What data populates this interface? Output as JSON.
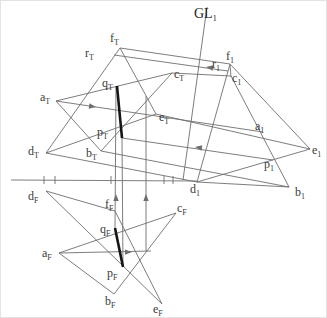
{
  "figure": {
    "width": 327,
    "height": 318,
    "background": "#ffffff",
    "line_color": "#6e6e6e",
    "line_width": 0.9,
    "thick_color": "#151515",
    "thick_width": 2.6,
    "label_color": "#3a3a3a",
    "tick_y1": 175,
    "tick_y2": 183,
    "segments": [
      {
        "name": "edge-fT-dT",
        "x1": 119,
        "y1": 47,
        "x2": 45,
        "y2": 152
      },
      {
        "name": "edge-fT-eT",
        "x1": 119,
        "y1": 47,
        "x2": 155,
        "y2": 113
      },
      {
        "name": "edge-dT-eT",
        "x1": 45,
        "y1": 152,
        "x2": 155,
        "y2": 113
      },
      {
        "name": "edge-aT-bT",
        "x1": 55,
        "y1": 100,
        "x2": 100,
        "y2": 150
      },
      {
        "name": "edge-bT-cT",
        "x1": 100,
        "y1": 150,
        "x2": 171,
        "y2": 72
      },
      {
        "name": "edge-cT-aT",
        "x1": 171,
        "y1": 72,
        "x2": 55,
        "y2": 100
      },
      {
        "name": "edge-dF-fF",
        "x1": 45,
        "y1": 190,
        "x2": 114,
        "y2": 210
      },
      {
        "name": "edge-fF-eF",
        "x1": 114,
        "y1": 210,
        "x2": 161,
        "y2": 303
      },
      {
        "name": "edge-dF-eF",
        "x1": 45,
        "y1": 190,
        "x2": 161,
        "y2": 303
      },
      {
        "name": "edge-aF-bF",
        "x1": 58,
        "y1": 252,
        "x2": 113,
        "y2": 293
      },
      {
        "name": "edge-bF-cF",
        "x1": 113,
        "y1": 293,
        "x2": 175,
        "y2": 212
      },
      {
        "name": "edge-cF-aF",
        "x1": 175,
        "y1": 212,
        "x2": 58,
        "y2": 252
      },
      {
        "name": "edge-f1-d1",
        "x1": 229,
        "y1": 63,
        "x2": 196,
        "y2": 181
      },
      {
        "name": "edge-f1-e1",
        "x1": 229,
        "y1": 63,
        "x2": 309,
        "y2": 148
      },
      {
        "name": "edge-d1-e1",
        "x1": 196,
        "y1": 181,
        "x2": 309,
        "y2": 148
      },
      {
        "name": "edgeview-line-c1-a1-b1",
        "x1": 230,
        "y1": 75,
        "x2": 288,
        "y2": 186
      },
      {
        "name": "line-d1-b1",
        "x1": 196,
        "y1": 181,
        "x2": 288,
        "y2": 186
      },
      {
        "name": "tick-c1",
        "x1": 229,
        "y1": 64,
        "x2": 230,
        "y2": 76
      },
      {
        "name": "projection-ray-f",
        "x1": 119,
        "y1": 47,
        "x2": 229,
        "y2": 63
      },
      {
        "name": "projection-ray-r",
        "x1": 113,
        "y1": 54,
        "x2": 227,
        "y2": 70
      },
      {
        "name": "projection-ray-c",
        "x1": 171,
        "y1": 72,
        "x2": 230,
        "y2": 75
      },
      {
        "name": "projection-ray-a",
        "x1": 55,
        "y1": 100,
        "x2": 262,
        "y2": 131
      },
      {
        "name": "projection-ray-e",
        "x1": 155,
        "y1": 113,
        "x2": 309,
        "y2": 148
      },
      {
        "name": "projection-ray-p",
        "x1": 121,
        "y1": 137,
        "x2": 272,
        "y2": 159
      },
      {
        "name": "projection-ray-d",
        "x1": 45,
        "y1": 152,
        "x2": 196,
        "y2": 181
      },
      {
        "name": "projection-ray-b",
        "x1": 100,
        "y1": 150,
        "x2": 288,
        "y2": 186
      },
      {
        "name": "projection-ray-aF",
        "x1": 58,
        "y1": 252,
        "x2": 150,
        "y2": 250
      },
      {
        "name": "ground-line-GL1",
        "x1": 206,
        "y1": 6,
        "x2": 182,
        "y2": 179
      },
      {
        "name": "reference-axis",
        "x1": 10,
        "y1": 179,
        "x2": 196,
        "y2": 180
      },
      {
        "name": "projection-vertical-q",
        "x1": 115,
        "y1": 85,
        "x2": 114,
        "y2": 227
      },
      {
        "name": "projection-vertical-p",
        "x1": 121,
        "y1": 137,
        "x2": 122,
        "y2": 266
      },
      {
        "name": "projection-vertical-aux",
        "x1": 145,
        "y1": 95,
        "x2": 145,
        "y2": 250
      }
    ],
    "thick_segments": [
      {
        "name": "segment-qT-pT",
        "x1": 116,
        "y1": 85,
        "x2": 121,
        "y2": 137
      },
      {
        "name": "segment-qF-pF",
        "x1": 114,
        "y1": 227,
        "x2": 122,
        "y2": 266
      }
    ],
    "axis_ticks": [
      {
        "name": "axis-tick-1",
        "x": 43
      },
      {
        "name": "axis-tick-2",
        "x": 54
      },
      {
        "name": "axis-tick-3",
        "x": 110
      },
      {
        "name": "axis-tick-4",
        "x": 163
      },
      {
        "name": "axis-tick-5",
        "x": 172
      }
    ],
    "arrows": [
      {
        "name": "arrowhead-ray-a",
        "x": 95,
        "y": 106,
        "angle": 8.5
      },
      {
        "name": "arrowhead-ray-r",
        "x": 205,
        "y": 66,
        "angle": 188
      },
      {
        "name": "arrowhead-ray-p",
        "x": 194,
        "y": 146,
        "angle": 188
      },
      {
        "name": "arrowhead-ray-aF",
        "x": 131,
        "y": 251,
        "angle": -1
      },
      {
        "name": "arrowhead-vertical-q",
        "x": 115,
        "y": 193,
        "angle": -90
      },
      {
        "name": "arrowhead-vertical-aux",
        "x": 145,
        "y": 193,
        "angle": -90
      }
    ],
    "labels": [
      {
        "name": "label-GL1",
        "base": "GL",
        "sub": "1",
        "x": 193,
        "y": 6,
        "size": "large"
      },
      {
        "name": "label-fT",
        "base": "f",
        "sub": "T",
        "x": 109,
        "y": 31,
        "size": "normal"
      },
      {
        "name": "label-rT",
        "base": "r",
        "sub": "T",
        "x": 84,
        "y": 46,
        "size": "normal"
      },
      {
        "name": "label-qT",
        "base": "q",
        "sub": "T",
        "x": 101,
        "y": 76,
        "size": "normal"
      },
      {
        "name": "label-aT",
        "base": "a",
        "sub": "T",
        "x": 39,
        "y": 90,
        "size": "normal"
      },
      {
        "name": "label-cT",
        "base": "c",
        "sub": "T",
        "x": 173,
        "y": 67,
        "size": "normal"
      },
      {
        "name": "label-eT",
        "base": "e",
        "sub": "T",
        "x": 158,
        "y": 110,
        "size": "normal"
      },
      {
        "name": "label-pT",
        "base": "p",
        "sub": "T",
        "x": 96,
        "y": 125,
        "size": "normal"
      },
      {
        "name": "label-dT",
        "base": "d",
        "sub": "T",
        "x": 27,
        "y": 144,
        "size": "normal"
      },
      {
        "name": "label-bT",
        "base": "b",
        "sub": "T",
        "x": 85,
        "y": 146,
        "size": "normal"
      },
      {
        "name": "label-f1",
        "base": "f",
        "sub": "1",
        "x": 225,
        "y": 49,
        "size": "normal"
      },
      {
        "name": "label-r1",
        "base": "r",
        "sub": "1",
        "x": 211,
        "y": 57,
        "size": "normal"
      },
      {
        "name": "label-c1",
        "base": "c",
        "sub": "1",
        "x": 231,
        "y": 71,
        "size": "normal"
      },
      {
        "name": "label-a1",
        "base": "a",
        "sub": "1",
        "x": 254,
        "y": 119,
        "size": "normal"
      },
      {
        "name": "label-e1",
        "base": "e",
        "sub": "1",
        "x": 311,
        "y": 143,
        "size": "normal"
      },
      {
        "name": "label-p1",
        "base": "p",
        "sub": "1",
        "x": 263,
        "y": 157,
        "size": "normal"
      },
      {
        "name": "label-d1",
        "base": "d",
        "sub": "1",
        "x": 189,
        "y": 182,
        "size": "normal"
      },
      {
        "name": "label-b1",
        "base": "b",
        "sub": "1",
        "x": 294,
        "y": 185,
        "size": "normal"
      },
      {
        "name": "label-dF",
        "base": "d",
        "sub": "F",
        "x": 27,
        "y": 189,
        "size": "normal"
      },
      {
        "name": "label-fF",
        "base": "f",
        "sub": "F",
        "x": 104,
        "y": 197,
        "size": "normal"
      },
      {
        "name": "label-cF",
        "base": "c",
        "sub": "F",
        "x": 176,
        "y": 201,
        "size": "normal"
      },
      {
        "name": "label-qF",
        "base": "q",
        "sub": "F",
        "x": 99,
        "y": 222,
        "size": "normal"
      },
      {
        "name": "label-aF",
        "base": "a",
        "sub": "F",
        "x": 41,
        "y": 246,
        "size": "normal"
      },
      {
        "name": "label-pF",
        "base": "p",
        "sub": "F",
        "x": 106,
        "y": 266,
        "size": "normal"
      },
      {
        "name": "label-bF",
        "base": "b",
        "sub": "F",
        "x": 104,
        "y": 294,
        "size": "normal"
      },
      {
        "name": "label-eF",
        "base": "e",
        "sub": "F",
        "x": 152,
        "y": 302,
        "size": "normal"
      }
    ]
  }
}
